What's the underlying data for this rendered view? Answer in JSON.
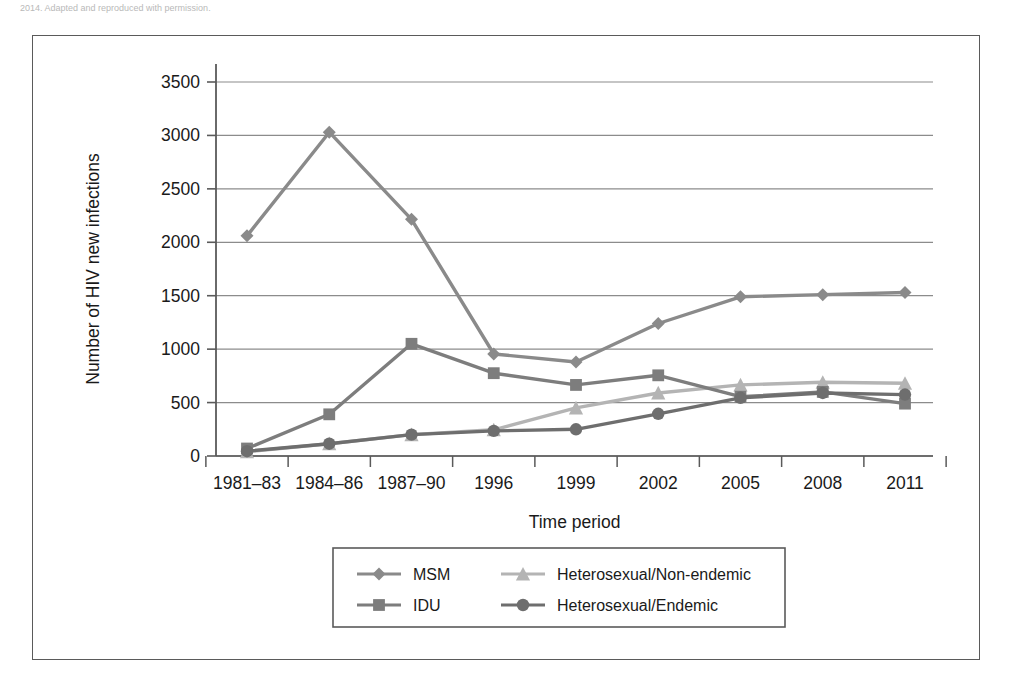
{
  "caption": {
    "text": "2014. Adapted and reproduced with permission."
  },
  "chart_data": {
    "type": "line",
    "title": "",
    "xlabel": "Time period",
    "ylabel": "Number of HIV new infections",
    "categories": [
      "1981–83",
      "1984–86",
      "1987–90",
      "1996",
      "1999",
      "2002",
      "2005",
      "2008",
      "2011"
    ],
    "ylim": [
      0,
      3500
    ],
    "ytick_values": [
      0,
      500,
      1000,
      1500,
      2000,
      2500,
      3000,
      3500
    ],
    "ytick_labels": [
      "0",
      "500",
      "1000",
      "1500",
      "2000",
      "2500",
      "3000",
      "3500"
    ],
    "grid": "horizontal",
    "legend_position": "below-center",
    "series": [
      {
        "name": "MSM",
        "marker": "diamond",
        "color": "#8a8a8a",
        "values": [
          2060,
          3030,
          2215,
          955,
          880,
          1240,
          1490,
          1510,
          1530
        ]
      },
      {
        "name": "IDU",
        "marker": "square",
        "color": "#7d7d7d",
        "values": [
          70,
          390,
          1050,
          775,
          665,
          755,
          555,
          600,
          490
        ]
      },
      {
        "name": "Heterosexual/Non-endemic",
        "marker": "triangle",
        "color": "#b4b4b4",
        "values": [
          40,
          115,
          200,
          245,
          450,
          590,
          665,
          690,
          680
        ]
      },
      {
        "name": "Heterosexual/Endemic",
        "marker": "circle",
        "color": "#6e6e6e",
        "values": [
          45,
          115,
          200,
          235,
          250,
          395,
          545,
          590,
          575
        ]
      }
    ]
  },
  "axis": {
    "frame_color": "#5a5a5a",
    "grid_color": "#8c8c8c",
    "text_color": "#1a1a1a"
  }
}
